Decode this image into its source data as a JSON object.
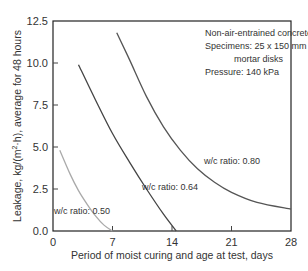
{
  "chart_data": {
    "type": "line",
    "title": "",
    "xlabel": "Period of moist curing and age at test, days",
    "ylabel": "Leakage, kg/(m²·h), average for 48 hours",
    "ylabel_parts": [
      "Leakage, kg/(m",
      "2",
      "·h), average for 48 hours"
    ],
    "xlim": [
      0,
      28
    ],
    "ylim": [
      0,
      12.5
    ],
    "xticks": [
      0,
      7,
      14,
      21,
      28
    ],
    "xtick_labels": [
      "0",
      "7",
      "14",
      "21",
      "28"
    ],
    "yticks": [
      0,
      2.5,
      5,
      7.5,
      10,
      12.5
    ],
    "ytick_labels": [
      "0.0",
      "2.5",
      "5.0",
      "7.5",
      "10.0",
      "12.5"
    ],
    "grid": false,
    "annotations": [
      "Non-air-entrained concrete",
      "Specimens: 25 x 150 mm",
      "mortar disks",
      "Pressure: 140 kPa"
    ],
    "series": [
      {
        "name": "w/c ratio: 0.80",
        "color": "#555555",
        "x": [
          7.5,
          9,
          11,
          13,
          15,
          17,
          19,
          21,
          24,
          28
        ],
        "y": [
          11.8,
          10.2,
          8.0,
          6.2,
          4.8,
          3.7,
          2.9,
          2.3,
          1.7,
          1.3
        ]
      },
      {
        "name": "w/c ratio: 0.64",
        "color": "#444444",
        "x": [
          3,
          5,
          7,
          9,
          11,
          13,
          14.5
        ],
        "y": [
          9.9,
          7.8,
          5.8,
          4.1,
          2.5,
          1.0,
          0
        ]
      },
      {
        "name": "w/c ratio: 0.50",
        "color": "#aaaaaa",
        "x": [
          0.8,
          2,
          3,
          4,
          5,
          6,
          7
        ],
        "y": [
          4.8,
          3.4,
          2.4,
          1.6,
          0.9,
          0.35,
          0
        ]
      }
    ]
  }
}
